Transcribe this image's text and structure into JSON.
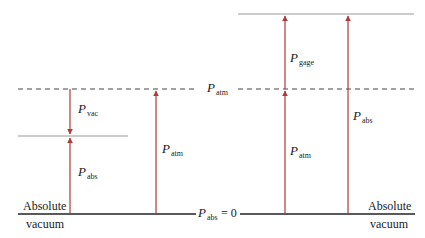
{
  "colors": {
    "arrow": "#b03a3a",
    "baseline": "#222222",
    "pressure_level": "#9a9a9a",
    "atm_dashed": "#444444"
  },
  "left_case": {
    "baseline_label_top": "Absolute",
    "baseline_label_bottom": "vacuum",
    "p_vac": {
      "symbol": "P",
      "subscript": "vac"
    },
    "p_abs": {
      "symbol": "P",
      "subscript": "abs"
    },
    "p_atm": {
      "symbol": "P",
      "subscript": "atm"
    }
  },
  "right_case": {
    "baseline_label_top": "Absolute",
    "baseline_label_bottom": "vacuum",
    "p_gage": {
      "symbol": "P",
      "subscript": "gage"
    },
    "p_atm": {
      "symbol": "P",
      "subscript": "atm"
    },
    "p_abs": {
      "symbol": "P",
      "subscript": "abs"
    }
  },
  "center": {
    "atm_line_label": {
      "symbol": "P",
      "subscript": "atm"
    },
    "zero_line_label": {
      "symbol": "P",
      "subscript": "abs",
      "suffix": "= 0"
    }
  }
}
